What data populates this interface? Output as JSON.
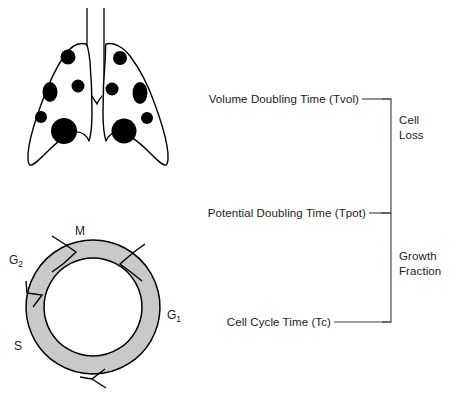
{
  "figure": {
    "background_color": "#ffffff",
    "stroke_color": "#000000",
    "ring_fill_color": "#c9c9c9",
    "nodule_color": "#000000",
    "bracket_color": "#444444"
  },
  "lungs": {
    "name": "lungs-with-metastatic-nodules",
    "nodule_count": 11
  },
  "cell_cycle": {
    "name": "cell-cycle-ring",
    "phases": [
      {
        "key": "M",
        "label": "M",
        "sub": ""
      },
      {
        "key": "G2",
        "label": "G",
        "sub": "2"
      },
      {
        "key": "S",
        "label": "S",
        "sub": ""
      },
      {
        "key": "G1",
        "label": "G",
        "sub": "1"
      }
    ]
  },
  "timescales": [
    {
      "id": "tvol",
      "text": "Volume Doubling Time (Tvol)"
    },
    {
      "id": "tpot",
      "text": "Potential Doubling Time (Tpot)"
    },
    {
      "id": "tc",
      "text": "Cell Cycle Time (Tc)"
    }
  ],
  "bracket_annotations": [
    {
      "id": "cell-loss",
      "line1": "Cell",
      "line2": "Loss"
    },
    {
      "id": "growth-fraction",
      "line1": "Growth",
      "line2": "Fraction"
    }
  ],
  "caption": {
    "text": ""
  }
}
